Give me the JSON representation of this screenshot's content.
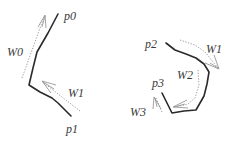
{
  "colors": {
    "stroke": "#2a2a2a",
    "dotted": "#9a9a9a",
    "arrow": "#8a8a8a",
    "text": "#3a3a3a",
    "background": "#ffffff"
  },
  "left_figure": {
    "labels": {
      "start_point": "p0",
      "end_point": "p1",
      "window_0": "W0",
      "window_1": "W1"
    }
  },
  "right_figure": {
    "labels": {
      "start_point": "p2",
      "end_point": "p3",
      "window_1": "W1",
      "window_2": "W2",
      "window_3": "W3"
    }
  }
}
